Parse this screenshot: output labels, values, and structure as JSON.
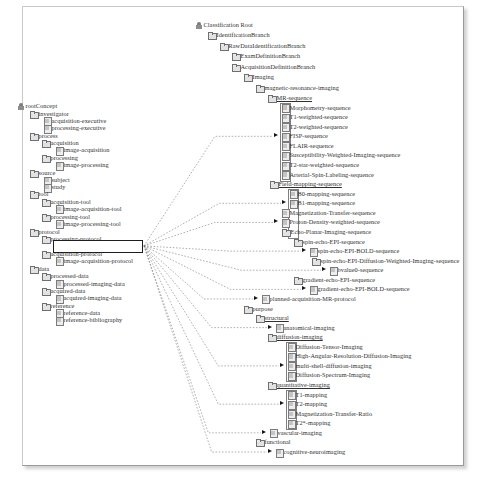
{
  "diagram": {
    "accent_color": "#1d1d1d",
    "line_color": "#6f6f6f",
    "icons": {
      "root": "root-icon",
      "folder": "folder-icon",
      "leaf": "leaf-icon",
      "arrow": "arrow-icon"
    }
  },
  "left_tree": {
    "name": "source-ontology-tree",
    "highlighted": "image-processing-protocol",
    "nodes": [
      {
        "label": "rootConcept",
        "depth": 0,
        "icon": "root",
        "x": 18,
        "y": 108
      },
      {
        "label": "investigator",
        "depth": 1,
        "icon": "folder",
        "x": 30,
        "y": 121
      },
      {
        "label": "acquisition-executive",
        "depth": 2,
        "icon": "leaf",
        "x": 44,
        "y": 133
      },
      {
        "label": "processing-executive",
        "depth": 2,
        "icon": "leaf",
        "x": 44,
        "y": 145
      },
      {
        "label": "process",
        "depth": 1,
        "icon": "folder",
        "x": 30,
        "y": 158
      },
      {
        "label": "acquisition",
        "depth": 2,
        "icon": "folder",
        "x": 42,
        "y": 170
      },
      {
        "label": "image-acquisition",
        "depth": 3,
        "icon": "leaf",
        "x": 56,
        "y": 182
      },
      {
        "label": "processing",
        "depth": 2,
        "icon": "folder",
        "x": 42,
        "y": 195
      },
      {
        "label": "image-processing",
        "depth": 3,
        "icon": "leaf",
        "x": 56,
        "y": 207
      },
      {
        "label": "source",
        "depth": 1,
        "icon": "folder",
        "x": 30,
        "y": 220
      },
      {
        "label": "subject",
        "depth": 2,
        "icon": "leaf",
        "x": 44,
        "y": 232
      },
      {
        "label": "study",
        "depth": 2,
        "icon": "leaf",
        "x": 44,
        "y": 244
      },
      {
        "label": "tool",
        "depth": 1,
        "icon": "folder",
        "x": 30,
        "y": 256
      },
      {
        "label": "acquisition-tool",
        "depth": 2,
        "icon": "folder",
        "x": 42,
        "y": 268
      },
      {
        "label": "image-acquisition-tool",
        "depth": 3,
        "icon": "leaf",
        "x": 56,
        "y": 280
      },
      {
        "label": "processing-tool",
        "depth": 2,
        "icon": "folder",
        "x": 42,
        "y": 293
      },
      {
        "label": "image-processing-tool",
        "depth": 3,
        "icon": "leaf",
        "x": 56,
        "y": 305
      },
      {
        "label": "protocol",
        "depth": 1,
        "icon": "folder",
        "x": 30,
        "y": 318
      },
      {
        "label": "processing-protocol",
        "depth": 2,
        "icon": "folder",
        "x": 42,
        "y": 330,
        "underline": true
      },
      {
        "label": "image-processing-protocol",
        "depth": 3,
        "icon": "leaf",
        "x": 56,
        "y": 342,
        "highlight": true
      },
      {
        "label": "acquisition-protocol",
        "depth": 2,
        "icon": "folder",
        "x": 42,
        "y": 355
      },
      {
        "label": "image-acquisition-protocol",
        "depth": 3,
        "icon": "leaf",
        "x": 56,
        "y": 367
      },
      {
        "label": "data",
        "depth": 1,
        "icon": "folder",
        "x": 30,
        "y": 381
      },
      {
        "label": "processed-data",
        "depth": 2,
        "icon": "folder",
        "x": 42,
        "y": 393
      },
      {
        "label": "processed-imaging-data",
        "depth": 3,
        "icon": "leaf",
        "x": 56,
        "y": 405
      },
      {
        "label": "acquired-data",
        "depth": 2,
        "icon": "folder",
        "x": 42,
        "y": 418
      },
      {
        "label": "acquired-imaging-data",
        "depth": 3,
        "icon": "leaf",
        "x": 56,
        "y": 430
      },
      {
        "label": "reference",
        "depth": 2,
        "icon": "folder",
        "x": 42,
        "y": 442
      },
      {
        "label": "reference-data",
        "depth": 3,
        "icon": "leaf",
        "x": 56,
        "y": 454
      },
      {
        "label": "reference-bibliography",
        "depth": 3,
        "icon": "leaf",
        "x": 56,
        "y": 466
      }
    ]
  },
  "right_tree": {
    "name": "classification-tree",
    "nodes": [
      {
        "label": "Classification Root",
        "icon": "root",
        "x": 196,
        "y": 25
      },
      {
        "label": "IdentificationBranch",
        "icon": "folder",
        "x": 208,
        "y": 37
      },
      {
        "label": "RawDataIdentificationBranch",
        "icon": "folder",
        "x": 220,
        "y": 49
      },
      {
        "label": "ExamDefinitionBranch",
        "icon": "folder",
        "x": 232,
        "y": 61
      },
      {
        "label": "AcquisitionDefinitionBranch",
        "icon": "folder",
        "x": 232,
        "y": 73
      },
      {
        "label": "Imaging",
        "icon": "folder",
        "x": 244,
        "y": 85
      },
      {
        "label": "magnetic-resonance-imaging",
        "icon": "folder",
        "x": 256,
        "y": 97
      },
      {
        "label": "MR-sequence",
        "icon": "folder",
        "x": 268,
        "y": 109,
        "underline": true
      },
      {
        "label": "Morphometry-sequence",
        "icon": "leaf",
        "x": 282,
        "y": 120,
        "grouped": true
      },
      {
        "label": "T1-weighted-sequence",
        "icon": "leaf",
        "x": 282,
        "y": 131,
        "grouped": true
      },
      {
        "label": "T2-weighted-sequence",
        "icon": "leaf",
        "x": 282,
        "y": 142,
        "grouped": true
      },
      {
        "label": "FISP-sequence",
        "icon": "leaf",
        "x": 282,
        "y": 153,
        "grouped": true,
        "target": true
      },
      {
        "label": "FLAIR-sequence",
        "icon": "leaf",
        "x": 282,
        "y": 164,
        "grouped": true
      },
      {
        "label": "Susceptibility-Weighted-Imaging-sequence",
        "icon": "leaf",
        "x": 282,
        "y": 175,
        "grouped": true
      },
      {
        "label": "T2-star-weighted-sequence",
        "icon": "leaf",
        "x": 282,
        "y": 186,
        "grouped": true
      },
      {
        "label": "Arterial-Spin-Labeling-sequence",
        "icon": "leaf",
        "x": 282,
        "y": 197,
        "grouped": true
      },
      {
        "label": "Field-mapping-sequence",
        "icon": "folder",
        "x": 270,
        "y": 208,
        "underline": true
      },
      {
        "label": "B0-mapping-sequence",
        "icon": "leaf",
        "x": 290,
        "y": 219,
        "grouped": true
      },
      {
        "label": "B1-mapping-sequence",
        "icon": "leaf",
        "x": 290,
        "y": 230,
        "grouped": true,
        "target": true
      },
      {
        "label": "Magnetization-Transfer-sequence",
        "icon": "leaf",
        "x": 282,
        "y": 241,
        "grouped": true
      },
      {
        "label": "Proton-Density-weighted-sequence",
        "icon": "leaf",
        "x": 282,
        "y": 252,
        "grouped": true,
        "target": true
      },
      {
        "label": "Echo-Planar-Imaging-sequence",
        "icon": "folder",
        "x": 282,
        "y": 263,
        "grouped": true
      },
      {
        "label": "spin-echo-EPI-sequence",
        "icon": "folder",
        "x": 294,
        "y": 274
      },
      {
        "label": "spin-echo-EPI-BOLD-sequence",
        "icon": "leaf",
        "x": 310,
        "y": 285,
        "target": true
      },
      {
        "label": "spin-echo-EPI-Diffusion-Weighted-Imaging-sequence",
        "icon": "folder",
        "x": 312,
        "y": 296
      },
      {
        "label": "bvalue0-sequence",
        "icon": "leaf",
        "x": 330,
        "y": 307,
        "target": true
      },
      {
        "label": "gradient-echo-EPI-sequence",
        "icon": "folder",
        "x": 294,
        "y": 318
      },
      {
        "label": "gradient-echo-EPI-BOLD-sequence",
        "icon": "leaf",
        "x": 310,
        "y": 329,
        "target": true
      },
      {
        "label": "planned-acquisition-MR-protocol",
        "icon": "leaf",
        "x": 262,
        "y": 340,
        "target": true
      },
      {
        "label": "purpose",
        "icon": "folder",
        "x": 244,
        "y": 351
      },
      {
        "label": "structural",
        "icon": "folder",
        "x": 256,
        "y": 362,
        "underline": true
      },
      {
        "label": "anatomical-imaging",
        "icon": "leaf",
        "x": 276,
        "y": 373,
        "target": true
      },
      {
        "label": "diffusion-imaging",
        "icon": "folder",
        "x": 268,
        "y": 384,
        "underline": true
      },
      {
        "label": "Diffusion-Tensor-Imaging",
        "icon": "leaf",
        "x": 288,
        "y": 395,
        "grouped": true
      },
      {
        "label": "High-Angular-Resolution-Diffusion-Imaging",
        "icon": "leaf",
        "x": 288,
        "y": 406,
        "grouped": true
      },
      {
        "label": "multi-shell-diffusion-imaging",
        "icon": "leaf",
        "x": 288,
        "y": 417,
        "grouped": true,
        "target": true
      },
      {
        "label": "Diffusion-Spectrum-Imaging",
        "icon": "leaf",
        "x": 288,
        "y": 428,
        "grouped": true
      },
      {
        "label": "quantitative-imaging",
        "icon": "folder",
        "x": 268,
        "y": 439,
        "underline": true
      },
      {
        "label": "T1-mapping",
        "icon": "leaf",
        "x": 288,
        "y": 450,
        "grouped": true
      },
      {
        "label": "T2-mapping",
        "icon": "leaf",
        "x": 288,
        "y": 461,
        "grouped": true,
        "target": true
      },
      {
        "label": "Magnetization-Transfer-Ratio",
        "icon": "leaf",
        "x": 288,
        "y": 472,
        "grouped": true
      },
      {
        "label": "T2*-mapping",
        "icon": "leaf",
        "x": 288,
        "y": 483,
        "grouped": true
      },
      {
        "label": "vascular-imaging",
        "icon": "leaf",
        "x": 270,
        "y": 494,
        "target": true
      },
      {
        "label": "functional",
        "icon": "folder",
        "x": 256,
        "y": 505
      },
      {
        "label": "cognitive-neuroimaging",
        "icon": "leaf",
        "x": 276,
        "y": 516,
        "target": true
      }
    ]
  }
}
